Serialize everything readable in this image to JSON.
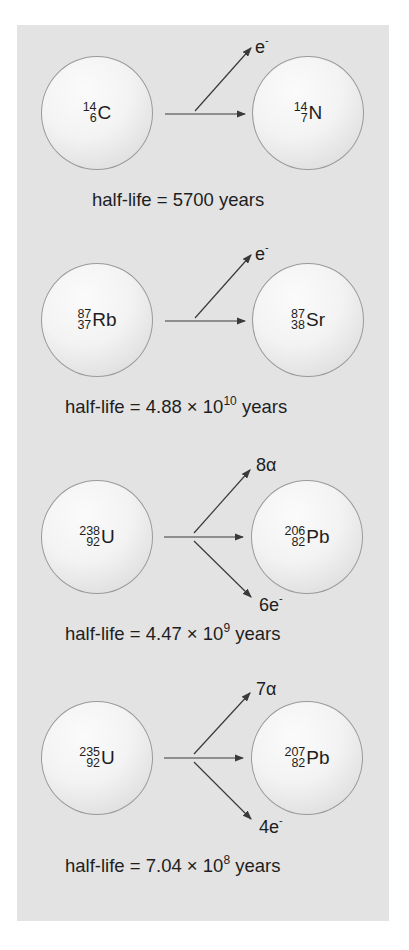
{
  "diagram": {
    "background_color": "#e3e3e3",
    "decays": [
      {
        "parent": {
          "mass": "14",
          "atomic": "6",
          "symbol": "C"
        },
        "daughter": {
          "mass": "14",
          "atomic": "7",
          "symbol": "N"
        },
        "emissions": [
          {
            "label": "e",
            "superscript": "-",
            "direction": "up"
          }
        ],
        "half_life": {
          "prefix": "half-life = 5700 years",
          "mantissa": "",
          "exponent": "",
          "suffix": ""
        }
      },
      {
        "parent": {
          "mass": "87",
          "atomic": "37",
          "symbol": "Rb"
        },
        "daughter": {
          "mass": "87",
          "atomic": "38",
          "symbol": "Sr"
        },
        "emissions": [
          {
            "label": "e",
            "superscript": "-",
            "direction": "up"
          }
        ],
        "half_life": {
          "prefix": "half-life = 4.88 × 10",
          "exponent": "10",
          "suffix": " years"
        }
      },
      {
        "parent": {
          "mass": "238",
          "atomic": "92",
          "symbol": "U"
        },
        "daughter": {
          "mass": "206",
          "atomic": "82",
          "symbol": "Pb"
        },
        "emissions": [
          {
            "label": "8α",
            "superscript": "",
            "direction": "up"
          },
          {
            "label": "6e",
            "superscript": "-",
            "direction": "down"
          }
        ],
        "half_life": {
          "prefix": "half-life = 4.47 × 10",
          "exponent": "9",
          "suffix": " years"
        }
      },
      {
        "parent": {
          "mass": "235",
          "atomic": "92",
          "symbol": "U"
        },
        "daughter": {
          "mass": "207",
          "atomic": "82",
          "symbol": "Pb"
        },
        "emissions": [
          {
            "label": "7α",
            "superscript": "",
            "direction": "up"
          },
          {
            "label": "4e",
            "superscript": "-",
            "direction": "down"
          }
        ],
        "half_life": {
          "prefix": "half-life = 7.04 × 10",
          "exponent": "8",
          "suffix": " years"
        }
      }
    ]
  }
}
